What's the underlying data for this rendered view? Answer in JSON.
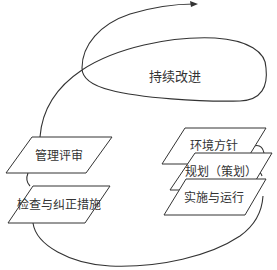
{
  "diagram": {
    "type": "continual-improvement-spiral",
    "colors": {
      "line": "#333333",
      "fill": "#ffffff",
      "text": "#333333"
    },
    "center_label": "持续改进",
    "left_boxes": [
      {
        "label": "管理评审"
      },
      {
        "label": "检查与纠正措施"
      }
    ],
    "right_boxes": [
      {
        "label": "环境方针"
      },
      {
        "label": "规划（策划）"
      },
      {
        "label": "实施与运行"
      }
    ],
    "arrow": {
      "direction": "right",
      "icon": "arrowhead-icon"
    }
  }
}
